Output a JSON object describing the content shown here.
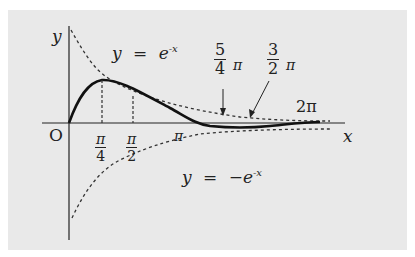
{
  "figure": {
    "axis_labels": {
      "y": "y",
      "x": "x",
      "origin": "O"
    },
    "curves": [
      {
        "name": "upper-envelope",
        "equation_lhs": "y",
        "equation_eq": "=",
        "equation_rhs": "e",
        "exponent": "-x",
        "style": "dashed"
      },
      {
        "name": "lower-envelope",
        "equation_lhs": "y",
        "equation_eq": "=",
        "equation_rhs": "−e",
        "exponent": "-x",
        "style": "dashed"
      },
      {
        "name": "damped-sine",
        "style": "solid"
      }
    ],
    "ticks": {
      "pi_over_4": {
        "num": "π",
        "den": "4"
      },
      "pi_over_2": {
        "num": "π",
        "den": "2"
      },
      "pi": "π",
      "five_quarters_pi": {
        "num": "5",
        "den": "4",
        "suffix": "π"
      },
      "three_halves_pi": {
        "num": "3",
        "den": "2",
        "suffix": "π"
      },
      "two_pi": "2π"
    },
    "colors": {
      "panel": "#e9e9e9",
      "ink": "#222222"
    }
  }
}
